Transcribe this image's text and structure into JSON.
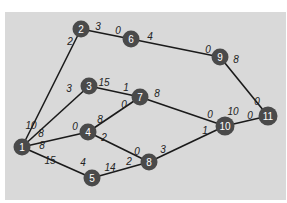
{
  "diagram": {
    "type": "network-graph",
    "background": "#d9d9d9",
    "node_color": "#4a4a4a",
    "edge_color": "#1a1a1a",
    "nodes": [
      {
        "id": "1",
        "label": "1",
        "x": 22,
        "y": 147
      },
      {
        "id": "2",
        "label": "2",
        "x": 81,
        "y": 29
      },
      {
        "id": "3",
        "label": "3",
        "x": 89,
        "y": 86
      },
      {
        "id": "4",
        "label": "4",
        "x": 88,
        "y": 132
      },
      {
        "id": "5",
        "label": "5",
        "x": 92,
        "y": 178
      },
      {
        "id": "6",
        "label": "6",
        "x": 131,
        "y": 39
      },
      {
        "id": "7",
        "label": "7",
        "x": 140,
        "y": 97
      },
      {
        "id": "8",
        "label": "8",
        "x": 149,
        "y": 162
      },
      {
        "id": "9",
        "label": "9",
        "x": 220,
        "y": 57
      },
      {
        "id": "10",
        "label": "10",
        "x": 225,
        "y": 126
      },
      {
        "id": "11",
        "label": "11",
        "x": 268,
        "y": 116
      }
    ],
    "edges": [
      {
        "from": "1",
        "to": "2",
        "from_label": "10",
        "to_label": "2",
        "fl": [
          31,
          125
        ],
        "tl": [
          70,
          41
        ]
      },
      {
        "from": "1",
        "to": "3",
        "from_label": "8",
        "to_label": "3",
        "fl": [
          41,
          133
        ],
        "tl": [
          69,
          88
        ]
      },
      {
        "from": "1",
        "to": "4",
        "from_label": "8",
        "to_label": "0",
        "fl": [
          42,
          145
        ],
        "tl": [
          75,
          126
        ]
      },
      {
        "from": "1",
        "to": "5",
        "from_label": "15",
        "to_label": "4",
        "fl": [
          50,
          160
        ],
        "tl": [
          83,
          162
        ]
      },
      {
        "from": "2",
        "to": "6",
        "from_label": "3",
        "to_label": "0",
        "fl": [
          98,
          26
        ],
        "tl": [
          118,
          30
        ]
      },
      {
        "from": "3",
        "to": "7",
        "from_label": "15",
        "to_label": "1",
        "fl": [
          104,
          82
        ],
        "tl": [
          126,
          87
        ]
      },
      {
        "from": "4",
        "to": "7",
        "from_label": "8",
        "to_label": "0",
        "fl": [
          100,
          119
        ],
        "tl": [
          124,
          104
        ]
      },
      {
        "from": "4",
        "to": "8",
        "from_label": "2",
        "to_label": "0",
        "fl": [
          104,
          137
        ],
        "tl": [
          137,
          151
        ]
      },
      {
        "from": "5",
        "to": "8",
        "from_label": "14",
        "to_label": "2",
        "fl": [
          110,
          167
        ],
        "tl": [
          129,
          161
        ]
      },
      {
        "from": "6",
        "to": "9",
        "from_label": "4",
        "to_label": "0",
        "fl": [
          150,
          36
        ],
        "tl": [
          208,
          49
        ]
      },
      {
        "from": "7",
        "to": "10",
        "from_label": "8",
        "to_label": "0",
        "fl": [
          157,
          93
        ],
        "tl": [
          210,
          114
        ]
      },
      {
        "from": "8",
        "to": "10",
        "from_label": "3",
        "to_label": "1",
        "fl": [
          163,
          149
        ],
        "tl": [
          205,
          130
        ]
      },
      {
        "from": "9",
        "to": "11",
        "from_label": "8",
        "to_label": "0",
        "fl": [
          236,
          59
        ],
        "tl": [
          257,
          101
        ]
      },
      {
        "from": "10",
        "to": "11",
        "from_label": "10",
        "to_label": "0",
        "fl": [
          233,
          111
        ],
        "tl": [
          250,
          115
        ]
      }
    ]
  }
}
